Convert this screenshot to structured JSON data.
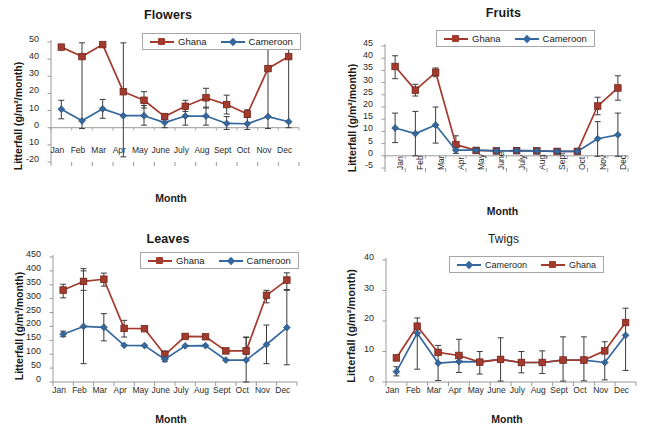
{
  "figure": {
    "series_colors": {
      "ghana": "#A33A2E",
      "cameroon": "#35689E",
      "error_bar": "#3b3b3b",
      "axis": "#9a9a9a"
    },
    "months": [
      "Jan",
      "Feb",
      "Mar",
      "Apr",
      "May",
      "June",
      "July",
      "Aug",
      "Sept",
      "Oct",
      "Nov",
      "Dec"
    ]
  },
  "chart_data": [
    {
      "type": "line",
      "panel": "flowers",
      "title": "Flowers",
      "xlabel": "Month",
      "ylabel": "Litterfall (g/m²/month)",
      "categories": [
        "Jan",
        "Feb",
        "Mar",
        "Apr",
        "May",
        "June",
        "July",
        "Aug",
        "Sept",
        "Oct",
        "Nov",
        "Dec"
      ],
      "ylim": [
        -20,
        50
      ],
      "yticks": [
        "50",
        "40",
        "30",
        "20",
        "10",
        "0",
        "10",
        "-20"
      ],
      "ytick_values": [
        50,
        40,
        30,
        20,
        10,
        0,
        -10,
        -20
      ],
      "grid": false,
      "legend_position": "top-center",
      "series": [
        {
          "name": "Ghana",
          "color": "#A33A2E",
          "marker": "square",
          "values": [
            47.0,
            41.5,
            48.5,
            21.0,
            16.0,
            6.5,
            12.5,
            17.5,
            13.5,
            8.0,
            34.5,
            41.5
          ],
          "err_low": [
            47.0,
            41.5,
            48.5,
            21.0,
            11.5,
            5.0,
            9.5,
            11.5,
            8.0,
            6.0,
            34.5,
            41.5
          ],
          "err_high": [
            47.0,
            41.5,
            48.5,
            21.0,
            21.0,
            8.0,
            16.0,
            23.0,
            19.0,
            10.5,
            34.5,
            41.5
          ]
        },
        {
          "name": "Cameroon",
          "color": "#35689E",
          "marker": "diamond",
          "values": [
            10.8,
            4.0,
            11.0,
            7.0,
            7.0,
            3.0,
            6.8,
            6.8,
            2.5,
            2.3,
            6.5,
            3.5
          ],
          "err_low": [
            5.2,
            -0.5,
            5.5,
            -17.0,
            1.5,
            0.0,
            1.5,
            1.5,
            -1.0,
            -1.0,
            -0.5,
            0.0
          ],
          "err_high": [
            16.0,
            49.5,
            16.5,
            49.5,
            13.0,
            6.5,
            12.0,
            12.0,
            6.5,
            6.0,
            49.5,
            48.5
          ]
        }
      ]
    },
    {
      "type": "line",
      "panel": "fruits",
      "title": "Fruits",
      "xlabel": "Month",
      "ylabel": "Litterfall (g/m²/month)",
      "categories": [
        "Jan",
        "Feb",
        "Mar",
        "Apr",
        "May",
        "June",
        "July",
        "Aug",
        "Sept",
        "Oct",
        "Nov",
        "Dec"
      ],
      "ylim": [
        -5,
        45
      ],
      "yticks": [
        "45",
        "40",
        "35",
        "30",
        "25",
        "20",
        "15",
        "10",
        "5",
        "0",
        "-5"
      ],
      "ytick_values": [
        45,
        40,
        35,
        30,
        25,
        20,
        15,
        10,
        5,
        0,
        -5
      ],
      "grid": false,
      "legend_position": "top-center",
      "xtick_rotation": 90,
      "series": [
        {
          "name": "Ghana",
          "color": "#A33A2E",
          "marker": "square",
          "values": [
            36.6,
            26.9,
            34.2,
            4.6,
            2.2,
            2.0,
            2.1,
            2.0,
            1.8,
            1.8,
            20.4,
            27.8
          ],
          "err_low": [
            31.6,
            24.5,
            32.4,
            2.4,
            1.2,
            1.2,
            1.2,
            1.2,
            1.0,
            1.0,
            16.8,
            22.8
          ],
          "err_high": [
            41.0,
            29.3,
            36.0,
            8.2,
            3.3,
            3.0,
            3.2,
            3.0,
            2.8,
            2.8,
            24.0,
            32.8
          ]
        },
        {
          "name": "Cameroon",
          "color": "#35689E",
          "marker": "diamond",
          "values": [
            11.4,
            9.1,
            12.6,
            2.3,
            2.3,
            2.0,
            2.1,
            2.0,
            1.8,
            1.8,
            7.0,
            8.6
          ],
          "err_low": [
            5.4,
            0.0,
            5.2,
            1.0,
            1.2,
            1.2,
            1.2,
            1.2,
            1.0,
            1.0,
            -0.2,
            -0.2
          ],
          "err_high": [
            17.5,
            18.2,
            20.0,
            3.6,
            3.3,
            3.0,
            3.2,
            3.0,
            2.8,
            2.8,
            14.0,
            17.5
          ]
        }
      ]
    },
    {
      "type": "line",
      "panel": "leaves",
      "title": "Leaves",
      "xlabel": "Month",
      "ylabel": "Litterfall (g/m²/month)",
      "categories": [
        "Jan",
        "Feb",
        "Mar",
        "Apr",
        "May",
        "June",
        "July",
        "Aug",
        "Sept",
        "Oct",
        "Nov",
        "Dec"
      ],
      "ylim": [
        0,
        450
      ],
      "yticks": [
        "450",
        "400",
        "350",
        "300",
        "250",
        "200",
        "150",
        "100",
        "50",
        "0"
      ],
      "ytick_values": [
        450,
        400,
        350,
        300,
        250,
        200,
        150,
        100,
        50,
        0
      ],
      "grid": false,
      "legend_position": "top-center",
      "series": [
        {
          "name": "Ghana",
          "color": "#A33A2E",
          "marker": "square",
          "values": [
            331,
            362,
            370,
            193,
            192,
            98,
            164,
            163,
            112,
            112,
            312,
            367
          ],
          "err_low": [
            303,
            330,
            345,
            162,
            192,
            80,
            164,
            163,
            112,
            100,
            285,
            330
          ],
          "err_high": [
            352,
            400,
            392,
            222,
            192,
            112,
            164,
            163,
            112,
            162,
            330,
            393
          ]
        },
        {
          "name": "Cameroon",
          "color": "#35689E",
          "marker": "diamond",
          "values": [
            172,
            200,
            197,
            132,
            131,
            82,
            130,
            131,
            79,
            79,
            135,
            196
          ],
          "err_low": [
            163,
            66,
            148,
            132,
            131,
            73,
            130,
            131,
            79,
            0,
            66,
            62
          ],
          "err_high": [
            183,
            408,
            246,
            132,
            131,
            95,
            130,
            131,
            79,
            160,
            205,
            333
          ]
        }
      ]
    },
    {
      "type": "line",
      "panel": "twigs",
      "title": "Twigs",
      "xlabel": "Month",
      "ylabel": "Litterfall (g/m²/month)",
      "categories": [
        "Jan",
        "Feb",
        "Mar",
        "Apr",
        "May",
        "June",
        "July",
        "Aug",
        "Sept",
        "Oct",
        "Nov",
        "Dec"
      ],
      "ylim": [
        0,
        40
      ],
      "yticks": [
        "40",
        "30",
        "20",
        "10",
        "0"
      ],
      "ytick_values": [
        40,
        30,
        20,
        10,
        0
      ],
      "grid": false,
      "legend_position": "top-center",
      "series": [
        {
          "name": "Cameroon",
          "color": "#35689E",
          "marker": "diamond",
          "values": [
            3.4,
            16.0,
            6.2,
            6.7,
            6.6,
            7.4,
            6.4,
            6.4,
            7.2,
            7.2,
            6.4,
            15.3
          ],
          "err_low": [
            2.0,
            4.2,
            0.5,
            3.1,
            2.6,
            0.3,
            3.0,
            2.8,
            0.3,
            0.4,
            0.7,
            3.8
          ],
          "err_high": [
            5.0,
            21.0,
            12.0,
            14.0,
            10.0,
            14.5,
            10.0,
            10.2,
            14.8,
            14.8,
            13.2,
            24.2
          ]
        },
        {
          "name": "Ghana",
          "color": "#A33A2E",
          "marker": "square",
          "values": [
            7.9,
            18.3,
            9.7,
            8.7,
            6.5,
            7.4,
            6.4,
            6.4,
            7.2,
            7.2,
            10.2,
            19.5
          ]
        }
      ]
    }
  ]
}
